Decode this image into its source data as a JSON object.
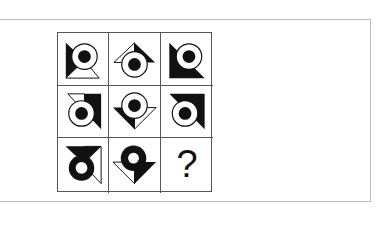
{
  "puzzle": {
    "rows": 3,
    "cols": 3,
    "cells": [
      {
        "row": 1,
        "col": 1,
        "figure": "circle-with-dot",
        "triangle": "left-black-bottom-white"
      },
      {
        "row": 1,
        "col": 2,
        "figure": "circle-with-dot",
        "triangle": "top-left-white-right-black"
      },
      {
        "row": 1,
        "col": 3,
        "figure": "circle-with-dot",
        "triangle": "left-black-bottom-black"
      },
      {
        "row": 2,
        "col": 1,
        "figure": "circle-with-dot",
        "triangle": "top-white-right-black"
      },
      {
        "row": 2,
        "col": 2,
        "figure": "circle-with-dot",
        "triangle": "bottom-left-black-right-white"
      },
      {
        "row": 2,
        "col": 3,
        "figure": "circle-with-dot",
        "triangle": "top-black-right-black"
      },
      {
        "row": 3,
        "col": 1,
        "figure": "black-ring-white-dot",
        "triangle": "top-black-right-white"
      },
      {
        "row": 3,
        "col": 2,
        "figure": "black-ring-white-dot",
        "triangle": "bottom-left-white-right-black"
      },
      {
        "row": 3,
        "col": 3,
        "figure": "unknown",
        "label": "?"
      }
    ]
  },
  "colors": {
    "ink": "#111111",
    "grid_line": "#555555",
    "frame_border": "#bdbdbd",
    "background": "#ffffff"
  }
}
